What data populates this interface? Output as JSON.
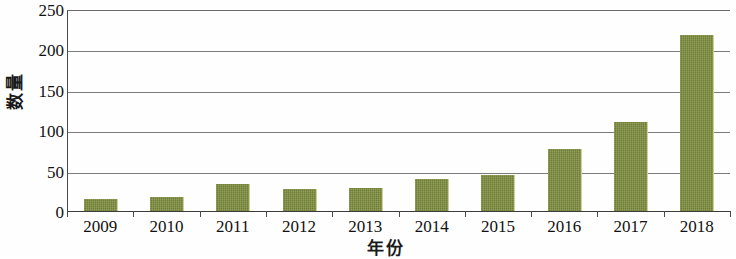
{
  "chart_data": {
    "type": "bar",
    "title": "",
    "subtitle": "",
    "xlabel": "年份",
    "ylabel": "数量",
    "categories": [
      "2009",
      "2010",
      "2011",
      "2012",
      "2013",
      "2014",
      "2015",
      "2016",
      "2017",
      "2018"
    ],
    "values": [
      16,
      19,
      35,
      29,
      30,
      41,
      46,
      78,
      112,
      219
    ],
    "series": [
      {
        "name": "数量",
        "values": [
          16,
          19,
          35,
          29,
          30,
          41,
          46,
          78,
          112,
          219
        ]
      }
    ],
    "ylim": [
      0,
      250
    ],
    "y_ticks": [
      0,
      50,
      100,
      150,
      200,
      250
    ],
    "y_tick_labels": [
      "0",
      "50",
      "100",
      "150",
      "200",
      "250"
    ],
    "grid": "horizontal",
    "legend": "none",
    "bar_color": "#7c8b3c",
    "axis_color": "#3c3c3c",
    "gridline_color": "#7c7c7c",
    "background_color": "#ffffff"
  }
}
